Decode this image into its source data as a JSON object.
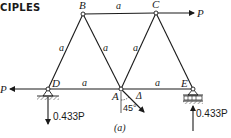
{
  "header": {
    "text": "CIPLES"
  },
  "figure": {
    "caption": "(a)",
    "nodes": [
      {
        "id": "B",
        "label": "B",
        "x": 83,
        "y": 14
      },
      {
        "id": "C",
        "label": "C",
        "x": 156,
        "y": 13
      },
      {
        "id": "D",
        "label": "D",
        "x": 48,
        "y": 89
      },
      {
        "id": "A",
        "label": "A",
        "x": 121,
        "y": 89
      },
      {
        "id": "E",
        "label": "E",
        "x": 193,
        "y": 89
      }
    ],
    "member_labels": {
      "BC": "a",
      "DB": "a",
      "BA": "a",
      "AC": "a",
      "DA": "a",
      "AE": "a"
    },
    "loads": {
      "P_at_C": "P",
      "P_at_D": "P",
      "reaction_D": "0.433P",
      "reaction_E": "0.433P"
    },
    "displacement": {
      "label": "Δ",
      "angle": "45°"
    },
    "colors": {
      "ink": "#1a1a1a",
      "hatch": "#555555"
    }
  }
}
